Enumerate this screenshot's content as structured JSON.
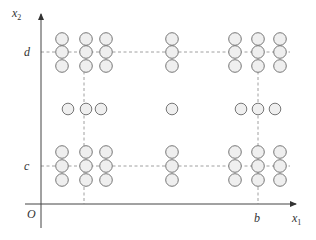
{
  "axes": {
    "x_label": "x",
    "x_sub": "1",
    "y_label": "x",
    "y_sub": "2",
    "origin_label": "O"
  },
  "ticks": {
    "b": "b",
    "c": "c",
    "d": "d"
  },
  "colors": {
    "axis": "#555555",
    "circle_stroke": "#777777",
    "circle_fill": "#efefef",
    "dashed": "#888888"
  },
  "grid": {
    "cols_left": [
      62,
      86,
      106
    ],
    "col_mid": 172,
    "cols_right": [
      235,
      258,
      280
    ],
    "rows_top": [
      39,
      52,
      66
    ],
    "rows_bottom": [
      152,
      166,
      180
    ],
    "row_middle": 109,
    "middle_row_x": [
      68,
      86,
      101,
      172,
      241,
      258,
      275
    ]
  }
}
